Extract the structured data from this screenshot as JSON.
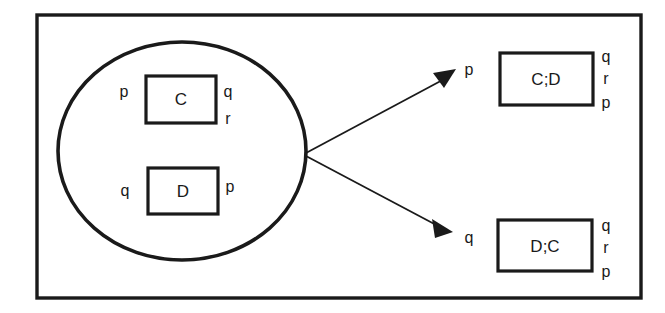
{
  "diagram": {
    "outer_frame": {
      "label": "outer-frame"
    },
    "container": {
      "shape": "ellipse",
      "label": "concurrent-composition-ellipse",
      "nodes": [
        {
          "id": "node-c",
          "label": "C",
          "left_annotations": [
            "p"
          ],
          "right_annotations": [
            "q",
            "r"
          ]
        },
        {
          "id": "node-d",
          "label": "D",
          "left_annotations": [
            "q"
          ],
          "right_annotations": [
            "p"
          ]
        }
      ]
    },
    "arrows": [
      {
        "id": "arrow-to-cd",
        "label": "p",
        "direction": "up-right"
      },
      {
        "id": "arrow-to-dc",
        "label": "q",
        "direction": "down-right"
      }
    ],
    "results": [
      {
        "id": "node-cd",
        "label": "C;D",
        "right_annotations": [
          "q",
          "r",
          "p"
        ]
      },
      {
        "id": "node-dc",
        "label": "D;C",
        "right_annotations": [
          "q",
          "r",
          "p"
        ]
      }
    ],
    "colors": {
      "ink": "#1a1a1a",
      "background": "#ffffff"
    }
  }
}
